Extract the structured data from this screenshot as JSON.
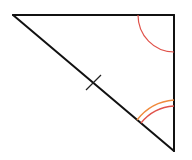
{
  "diagram": {
    "type": "triangle",
    "vertices": {
      "top_left": [
        13,
        15
      ],
      "top_right": [
        174,
        15
      ],
      "bottom_right": [
        174,
        151
      ]
    },
    "edge_color": "#111111",
    "angle_marks": [
      {
        "vertex": "top_right",
        "arcs": 1,
        "color": "#e0524a"
      },
      {
        "vertex": "bottom_right",
        "arcs": 2,
        "colors": [
          "#f08a3c",
          "#e0524a"
        ]
      }
    ],
    "tick_marks": [
      {
        "edge": "hypotenuse",
        "count": 1
      }
    ]
  }
}
